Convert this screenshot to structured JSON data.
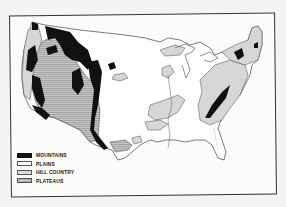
{
  "map": {
    "subject": "Physiographic regions of the contiguous United States",
    "colors": {
      "mountains": "#111111",
      "plains": "#ffffff",
      "hill_country": "#dddddd",
      "plateaus": "#bbbbbb",
      "outline": "#444444",
      "background": "#fbfbfa"
    }
  },
  "legend": {
    "items": [
      {
        "key": "mountains",
        "label": "MOUNTAINS"
      },
      {
        "key": "plains",
        "label": "PLAINS"
      },
      {
        "key": "hill_country",
        "label": "HILL COUNTRY"
      },
      {
        "key": "plateaus",
        "label": "PLATEAUS"
      }
    ]
  }
}
